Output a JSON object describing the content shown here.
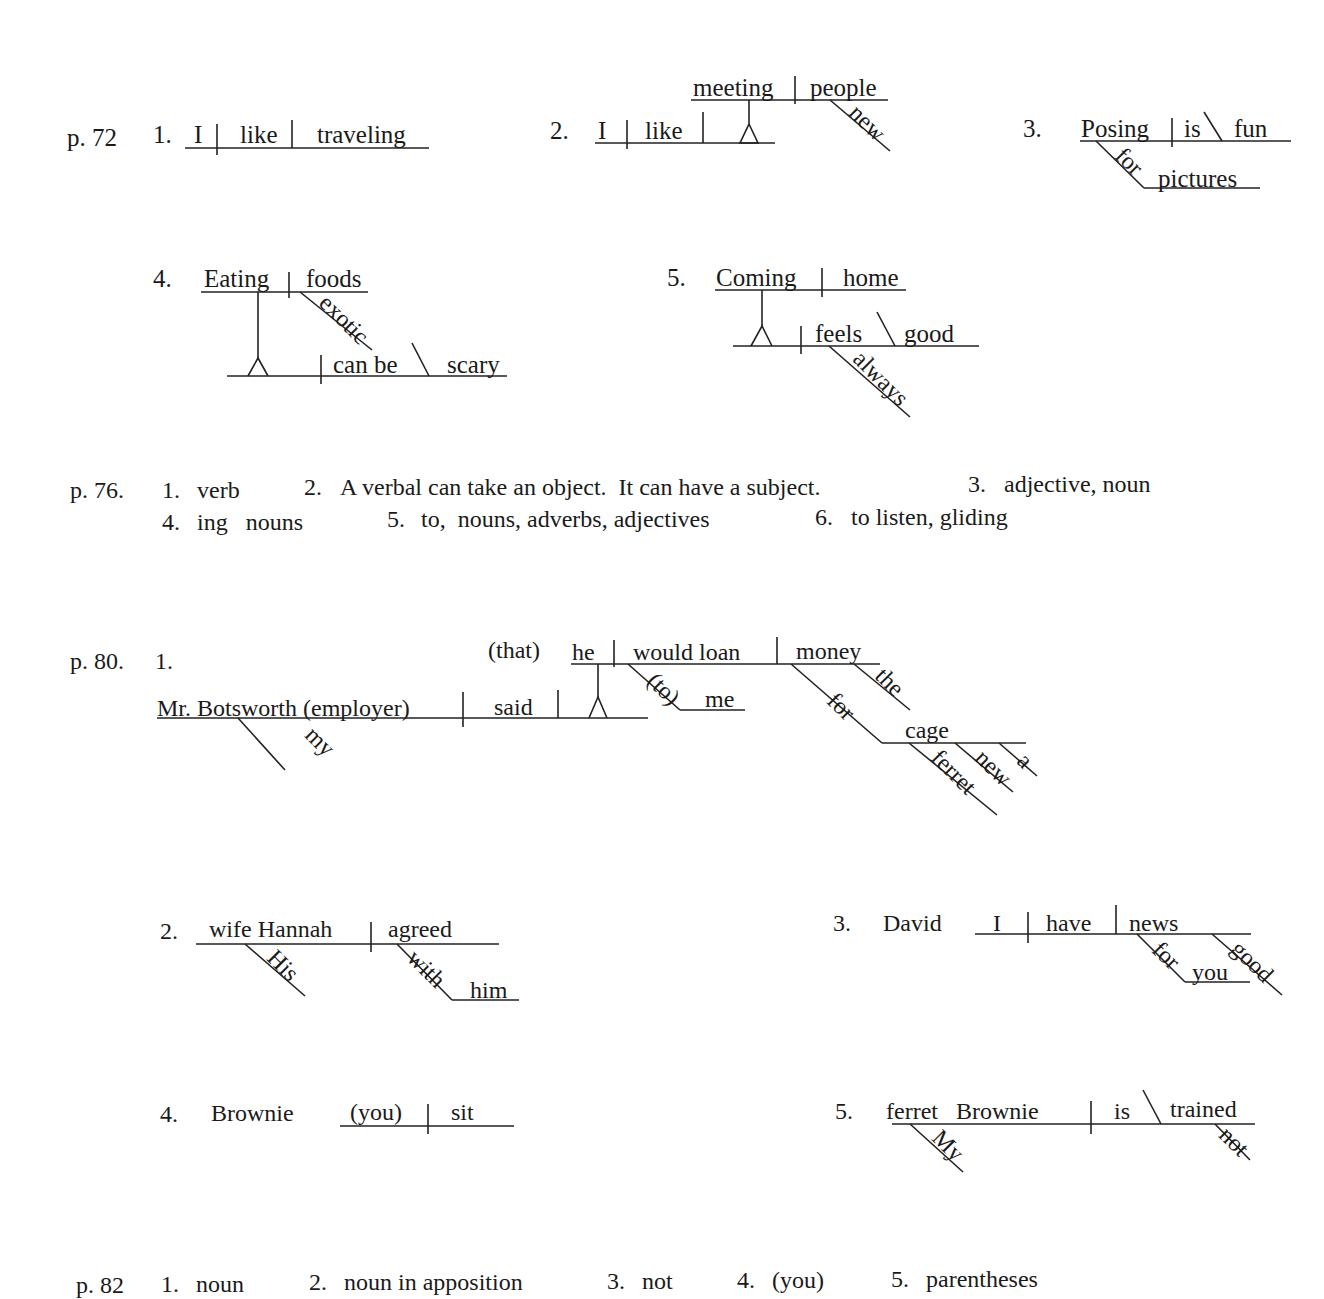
{
  "sections": {
    "p72": {
      "label": "p. 72",
      "items": {
        "n1": {
          "num": "1.",
          "subject": "I",
          "verb": "like",
          "object": "traveling"
        },
        "n2": {
          "num": "2.",
          "subject": "I",
          "verb": "like",
          "gerund": "meeting",
          "gerund_object": "people",
          "modifier": "new"
        },
        "n3": {
          "num": "3.",
          "subject": "Posing",
          "verb": "is",
          "complement": "fun",
          "preposition": "for",
          "prep_object": "pictures"
        },
        "n4": {
          "num": "4.",
          "gerund": "Eating",
          "gerund_object": "foods",
          "modifier": "exotic",
          "verb": "can be",
          "complement": "scary"
        },
        "n5": {
          "num": "5.",
          "gerund": "Coming",
          "gerund_object": "home",
          "verb": "feels",
          "complement": "good",
          "modifier": "always"
        }
      }
    },
    "p76": {
      "label": "p. 76.",
      "line1": [
        {
          "num": "1.",
          "text": "verb"
        },
        {
          "num": "2.",
          "text": "A verbal can take an object.  It can have a subject."
        },
        {
          "num": "3.",
          "text": "adjective, noun"
        }
      ],
      "line2": [
        {
          "num": "4.",
          "text": "ing   nouns"
        },
        {
          "num": "5.",
          "text": "to,  nouns, adverbs, adjectives"
        },
        {
          "num": "6.",
          "text": "to listen, gliding"
        }
      ]
    },
    "p80": {
      "label": "p. 80.",
      "items": {
        "n1": {
          "num": "1.",
          "subject": "Mr. Botsworth (employer)",
          "verb": "said",
          "subject_mod": "my",
          "clause_intro": "(that)",
          "clause_subject": "he",
          "clause_verb": "would loan",
          "clause_object": "money",
          "object_mod": "the",
          "to_prep": "(to)",
          "to_object": "me",
          "for_prep": "for",
          "for_object": "cage",
          "cage_mods": [
            "ferret",
            "new",
            "a"
          ]
        },
        "n2": {
          "num": "2.",
          "subject": "wife Hannah",
          "verb": "agreed",
          "subject_mod": "His",
          "preposition": "with",
          "prep_object": "him"
        },
        "n3": {
          "num": "3.",
          "direct_address": "David",
          "subject": "I",
          "verb": "have",
          "object": "news",
          "preposition": "for",
          "prep_object": "you",
          "object_mod": "good"
        },
        "n4": {
          "num": "4.",
          "direct_address": "Brownie",
          "subject": "(you)",
          "verb": "sit"
        },
        "n5": {
          "num": "5.",
          "subject": "ferret   Brownie",
          "verb": "is",
          "complement": "trained",
          "subject_mod": "My",
          "verb_mod": "not"
        }
      }
    },
    "p82": {
      "label": "p. 82",
      "answers": [
        {
          "num": "1.",
          "text": "noun"
        },
        {
          "num": "2.",
          "text": "noun in apposition"
        },
        {
          "num": "3.",
          "text": "not"
        },
        {
          "num": "4.",
          "text": "(you)"
        },
        {
          "num": "5.",
          "text": "parentheses"
        }
      ]
    }
  }
}
